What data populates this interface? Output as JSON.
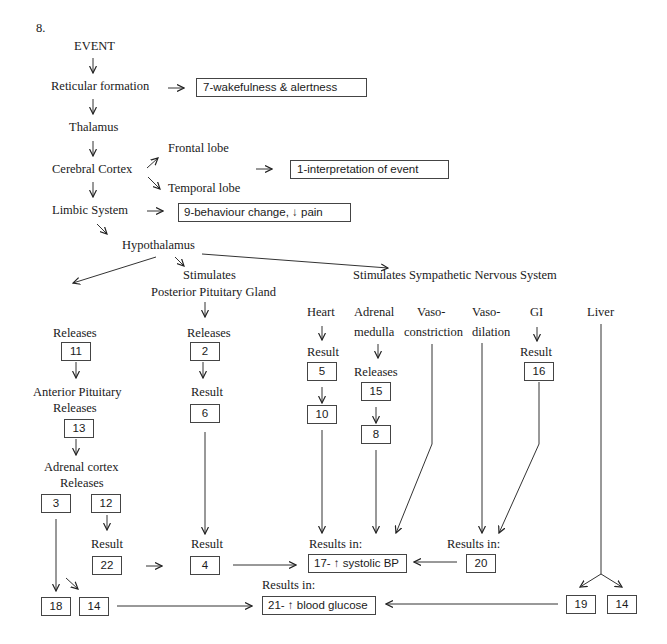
{
  "question_number": "8.",
  "nodes": {
    "event": "EVENT",
    "reticular_formation": "Reticular formation",
    "thalamus": "Thalamus",
    "cerebral_cortex": "Cerebral Cortex",
    "frontal_lobe": "Frontal lobe",
    "temporal_lobe": "Temporal lobe",
    "limbic_system": "Limbic System",
    "hypothalamus": "Hypothalamus",
    "stimulates_posterior_line1": "Stimulates",
    "stimulates_posterior_line2": "Posterior Pituitary Gland",
    "stimulates_sns": "Stimulates Sympathetic Nervous System"
  },
  "answer_boxes": {
    "box_7": "7-wakefulness & alertness",
    "box_1": "1-interpretation of event",
    "box_9": "9-behaviour change, ↓ pain",
    "box_17": "17- ↑ systolic BP",
    "box_21": "21- ↑ blood glucose"
  },
  "left_branch": {
    "releases_label": "Releases",
    "box_11": "11",
    "anterior_pituitary_line1": "Anterior Pituitary",
    "anterior_pituitary_line2": "Releases",
    "box_13": "13",
    "adrenal_cortex_line1": "Adrenal cortex",
    "adrenal_cortex_line2": "Releases",
    "box_3": "3",
    "box_12": "12",
    "result_label": "Result",
    "box_22": "22",
    "box_18": "18",
    "box_14": "14"
  },
  "posterior_branch": {
    "releases_label": "Releases",
    "box_2": "2",
    "result_label": "Result",
    "box_6": "6",
    "result_label_2": "Result",
    "box_4": "4"
  },
  "sns_branch": {
    "heart": "Heart",
    "heart_result": "Result",
    "box_5": "5",
    "box_10": "10",
    "adrenal_line1": "Adrenal",
    "adrenal_line2": "medulla",
    "adrenal_releases": "Releases",
    "box_15": "15",
    "box_8": "8",
    "vasoconstriction_line1": "Vaso-",
    "vasoconstriction_line2": "constriction",
    "vasodilation_line1": "Vaso-",
    "vasodilation_line2": "dilation",
    "gi": "GI",
    "gi_result": "Result",
    "box_16": "16",
    "liver": "Liver",
    "results_in_bp": "Results in:",
    "results_in_20": "Results in:",
    "box_20": "20",
    "results_in_glucose": "Results in:",
    "box_19": "19",
    "box_14": "14"
  }
}
